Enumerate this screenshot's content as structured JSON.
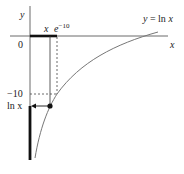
{
  "diagram": {
    "title": "",
    "curve_label": "y = ln x",
    "axis_labels": {
      "y": "y",
      "x": "x"
    },
    "tick_labels": {
      "origin": "0",
      "neg_ten": "−10"
    },
    "point_labels": {
      "x_point": "x",
      "e_neg10": "e",
      "e_neg10_exp": "−10",
      "ln_x": "ln x"
    },
    "colors": {
      "axis": "#333333",
      "curve": "#777777",
      "highlight": "#111111"
    }
  }
}
